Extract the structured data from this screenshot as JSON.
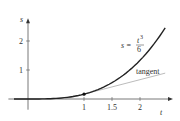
{
  "chart_data": {
    "type": "line",
    "title": "",
    "xlabel": "t",
    "ylabel": "s",
    "xlim": [
      -0.35,
      2.5
    ],
    "ylim": [
      -0.3,
      2.65
    ],
    "x_ticks": [
      {
        "v": 1,
        "label": "1"
      },
      {
        "v": 1.5,
        "label": "1.5"
      },
      {
        "v": 2,
        "label": "2"
      }
    ],
    "y_ticks": [
      {
        "v": 1,
        "label": "1"
      },
      {
        "v": 2,
        "label": "2"
      }
    ],
    "series": [
      {
        "name": "curve",
        "formula": "s = t^3 / 6",
        "t_range": [
          0,
          2.45
        ],
        "color": "#222222"
      },
      {
        "name": "tangent",
        "formula": "s = t/2 - 1/3",
        "t_range": [
          0.667,
          2.45
        ],
        "color": "#aaaaaa"
      }
    ],
    "point": {
      "t": 1,
      "s": 0.1667
    },
    "annotations": {
      "curve_label_lhs": "s =",
      "curve_label_num": "t",
      "curve_label_exp": "3",
      "curve_label_den": "6",
      "tangent_label": "tangent"
    },
    "grid": false
  }
}
